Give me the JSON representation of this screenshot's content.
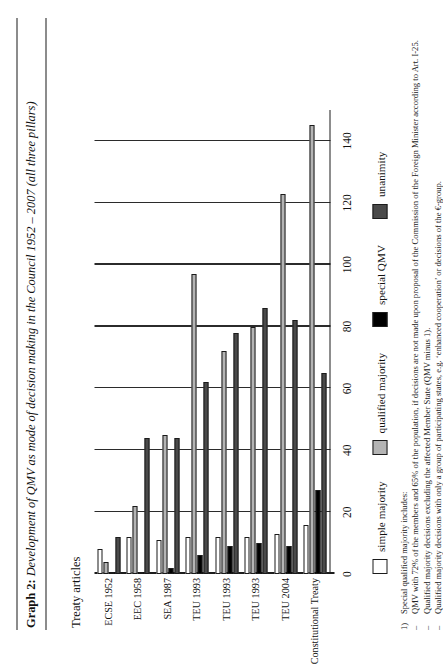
{
  "figure": {
    "label": "Graph 2:",
    "caption": "Development of QMV as mode of decision making in the Council 1952 – 2007 (all three pillars)"
  },
  "axis": {
    "y_title": "Treaty articles",
    "ticks": [
      "0",
      "20",
      "40",
      "60",
      "80",
      "100",
      "120",
      "140"
    ]
  },
  "legend": {
    "items": [
      {
        "label": "simple majority",
        "color": "#ffffff"
      },
      {
        "label": "qualified majority",
        "color": "#b4b4b4"
      },
      {
        "label": "special QMV",
        "color": "#000000"
      },
      {
        "label": "unanimity",
        "color": "#4a4a4a"
      }
    ]
  },
  "notes": [
    {
      "mark": "1)",
      "text": "Special qualified majority includes:"
    },
    {
      "mark": "–",
      "text": "QMV with 72% of the members and 65% of the population, if decisions are not made upon proposal of the Commission of the Foreign Minister according to Art. I-25."
    },
    {
      "mark": "–",
      "text": "Qualified majority decisions excluding the affected Member State (QMV minus 1)."
    },
    {
      "mark": "–",
      "text": "Qualified majority decisions with only a group of participating states, e.g. ‘enhanced cooperation’ or decisions of the €-group."
    }
  ],
  "chart_data": {
    "type": "bar",
    "orientation": "horizontal-rotated",
    "title": "Development of QMV as mode of decision making in the Council 1952 – 2007 (all three pillars)",
    "xlabel": "",
    "ylabel": "Treaty articles",
    "ylim": [
      0,
      150
    ],
    "grid": true,
    "legend_position": "bottom",
    "categories": [
      "ECSE 1952",
      "EEC 1958",
      "SEA 1987",
      "TEU 1993",
      "TEU 1993",
      "TEU 1993",
      "TEU 2004",
      "Constitutional Treaty"
    ],
    "series": [
      {
        "name": "simple majority",
        "color": "#ffffff",
        "values": [
          8,
          12,
          11,
          12,
          12,
          12,
          13,
          16
        ]
      },
      {
        "name": "qualified majority",
        "color": "#b4b4b4",
        "values": [
          4,
          22,
          45,
          97,
          72,
          80,
          123,
          145
        ]
      },
      {
        "name": "special QMV",
        "color": "#000000",
        "values": [
          0,
          0,
          2,
          6,
          9,
          10,
          9,
          27
        ]
      },
      {
        "name": "unanimity",
        "color": "#4a4a4a",
        "values": [
          12,
          44,
          44,
          62,
          78,
          86,
          82,
          65
        ]
      }
    ]
  }
}
